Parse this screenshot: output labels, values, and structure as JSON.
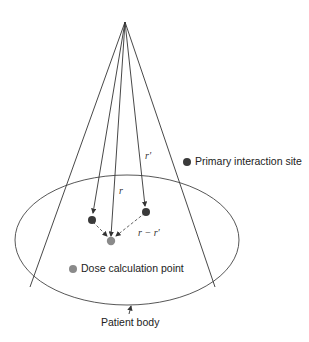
{
  "diagram": {
    "labels": {
      "primary_site": "Primary interaction site",
      "dose_point": "Dose calculation point",
      "patient_body": "Patient body",
      "vec_r_prime": "r′",
      "vec_r": "r",
      "vec_diff": "r − r′"
    },
    "colors": {
      "line": "#333333",
      "primary_dot": "#3a3a3a",
      "dose_dot": "#8a8a8a",
      "background": "#ffffff"
    }
  }
}
